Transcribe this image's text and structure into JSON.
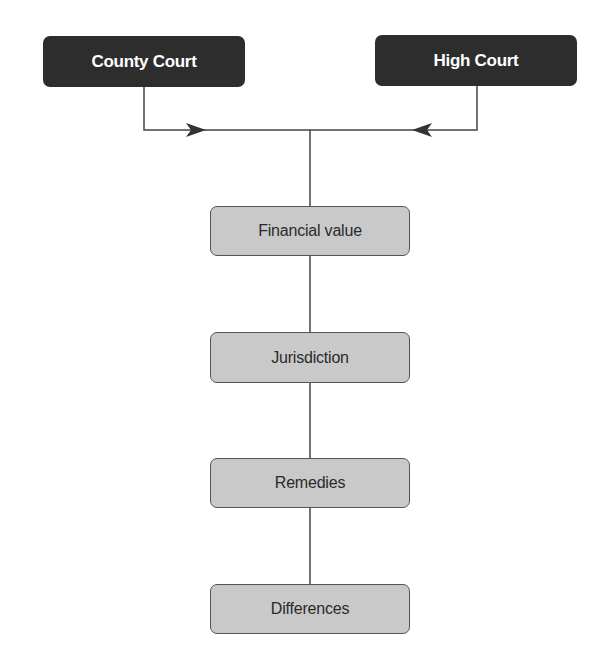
{
  "diagram": {
    "type": "flowchart",
    "top_nodes": [
      {
        "id": "county-court",
        "label": "County Court"
      },
      {
        "id": "high-court",
        "label": "High Court"
      }
    ],
    "chain_nodes": [
      {
        "id": "financial-value",
        "label": "Financial value"
      },
      {
        "id": "jurisdiction",
        "label": "Jurisdiction"
      },
      {
        "id": "remedies",
        "label": "Remedies"
      },
      {
        "id": "differences",
        "label": "Differences"
      }
    ],
    "edges": [
      {
        "from": "County Court",
        "to": "junction",
        "arrow": "right"
      },
      {
        "from": "High Court",
        "to": "junction",
        "arrow": "left"
      },
      {
        "from": "junction",
        "to": "Financial value"
      },
      {
        "from": "Financial value",
        "to": "Jurisdiction"
      },
      {
        "from": "Jurisdiction",
        "to": "Remedies"
      },
      {
        "from": "Remedies",
        "to": "Differences"
      }
    ],
    "colors": {
      "dark_box": "#2d2d2d",
      "light_box": "#c9c9c9",
      "line": "#444444"
    }
  }
}
